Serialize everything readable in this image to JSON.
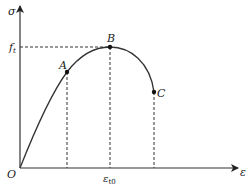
{
  "diagram": {
    "type": "stress-strain curve",
    "y_axis_label": "σ",
    "x_axis_label": "ε",
    "origin_label": "O",
    "y_tick_label": "f",
    "y_tick_subscript": "t",
    "x_tick_label": "ε",
    "x_tick_subscript": "t0",
    "points": [
      {
        "name": "A",
        "label": "A"
      },
      {
        "name": "B",
        "label": "B"
      },
      {
        "name": "C",
        "label": "C"
      }
    ],
    "colors": {
      "line": "#333333",
      "background": "#ffffff"
    }
  }
}
